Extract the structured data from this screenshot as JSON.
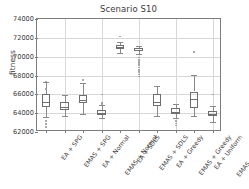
{
  "chart_data": {
    "type": "box",
    "title": "Scenario S10",
    "xlabel": "",
    "ylabel": "fitness",
    "ylim": [
      62000,
      74000
    ],
    "yticks": [
      62000,
      64000,
      66000,
      68000,
      70000,
      72000,
      74000
    ],
    "ytick_labels": [
      "62000",
      "64000",
      "66000",
      "68000",
      "70000",
      "72000",
      "74000"
    ],
    "grid": true,
    "legend": "none",
    "categories": [
      "EA + SPG",
      "EMAS + SPG",
      "EA + Normal",
      "EMAS + Normal",
      "EA + SDLS",
      "EMAS + SDLS",
      "EA + Greedy",
      "EMAS + Greedy",
      "EA + Uniform",
      "EMAS + Uniform"
    ],
    "boxes": [
      {
        "name": "EA + SPG",
        "whisker_low": 63550,
        "q1": 64700,
        "median": 65150,
        "q3": 66050,
        "whisker_high": 67350,
        "fliers": [
          67350,
          66550,
          63150,
          62850,
          62550
        ]
      },
      {
        "name": "EMAS + SPG",
        "whisker_low": 63750,
        "q1": 64300,
        "median": 64650,
        "q3": 65200,
        "whisker_high": 65950,
        "fliers": []
      },
      {
        "name": "EA + Normal",
        "whisker_low": 63950,
        "q1": 65050,
        "median": 65350,
        "q3": 65900,
        "whisker_high": 67200,
        "fliers": [
          67550
        ]
      },
      {
        "name": "EMAS + Normal",
        "whisker_low": 63450,
        "q1": 63850,
        "median": 64050,
        "q3": 64350,
        "whisker_high": 64900,
        "fliers": [
          66000,
          65050,
          64950
        ]
      },
      {
        "name": "EA + SDLS",
        "whisker_low": 70350,
        "q1": 70800,
        "median": 71000,
        "q3": 71250,
        "whisker_high": 71600,
        "fliers": [
          72150
        ]
      },
      {
        "name": "EMAS + SDLS",
        "whisker_low": 70300,
        "q1": 70600,
        "median": 70750,
        "q3": 70900,
        "whisker_high": 71150,
        "fliers": [
          69900,
          69650,
          69450,
          69250,
          69050,
          68850,
          68600,
          68350,
          68100,
          67900
        ]
      },
      {
        "name": "EA + Greedy",
        "whisker_low": 63700,
        "q1": 64750,
        "median": 65200,
        "q3": 66050,
        "whisker_high": 66900,
        "fliers": []
      },
      {
        "name": "EMAS + Greedy",
        "whisker_low": 63450,
        "q1": 63900,
        "median": 64150,
        "q3": 64500,
        "whisker_high": 64950,
        "fliers": [
          63150,
          62900,
          62700
        ]
      },
      {
        "name": "EA + Uniform",
        "whisker_low": 63750,
        "q1": 64600,
        "median": 65550,
        "q3": 66300,
        "whisker_high": 68100,
        "fliers": [
          70500
        ]
      },
      {
        "name": "EMAS + Uniform",
        "whisker_low": 63100,
        "q1": 63700,
        "median": 63950,
        "q3": 64250,
        "whisker_high": 64750,
        "fliers": [
          66000
        ]
      }
    ]
  }
}
